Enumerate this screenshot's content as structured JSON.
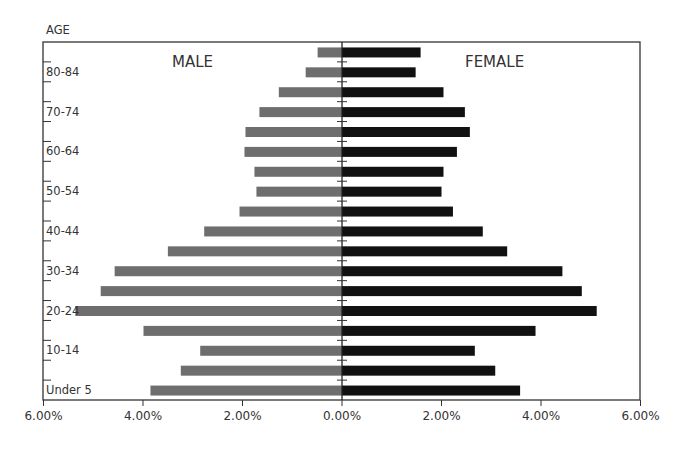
{
  "chart_data": {
    "type": "bar",
    "subtype": "population-pyramid",
    "title": "",
    "ylabel": "AGE",
    "xlabel": "",
    "categories": [
      "85+",
      "80-84",
      "75-79",
      "70-74",
      "65-69",
      "60-64",
      "55-59",
      "50-54",
      "45-49",
      "40-44",
      "35-39",
      "30-34",
      "25-29",
      "20-24",
      "15-19",
      "10-14",
      "5-9",
      "Under 5"
    ],
    "shown_category_labels": [
      "80-84",
      "70-74",
      "60-64",
      "50-54",
      "40-44",
      "30-34",
      "20-24",
      "10-14",
      "Under 5"
    ],
    "series": [
      {
        "name": "MALE",
        "side": "left",
        "color": "#6e6e6e",
        "values": [
          0.49,
          0.73,
          1.27,
          1.66,
          1.94,
          1.96,
          1.76,
          1.72,
          2.06,
          2.77,
          3.5,
          4.57,
          4.85,
          5.36,
          3.99,
          2.85,
          3.24,
          3.85
        ]
      },
      {
        "name": "FEMALE",
        "side": "right",
        "color": "#111111",
        "values": [
          1.58,
          1.48,
          2.04,
          2.47,
          2.57,
          2.31,
          2.04,
          2.0,
          2.23,
          2.83,
          3.32,
          4.43,
          4.82,
          5.12,
          3.89,
          2.67,
          3.08,
          3.58
        ]
      }
    ],
    "xlim": [
      -6,
      6
    ],
    "x_ticks": [
      -6,
      -4,
      -2,
      0,
      2,
      4,
      6
    ],
    "x_tick_labels": [
      "6.00%",
      "4.00%",
      "2.00%",
      "0.00%",
      "2.00%",
      "4.00%",
      "6.00%"
    ],
    "units": "percent of population",
    "grid": false,
    "legend": "in-plot labels top-left (MALE) and top-right (FEMALE)"
  }
}
